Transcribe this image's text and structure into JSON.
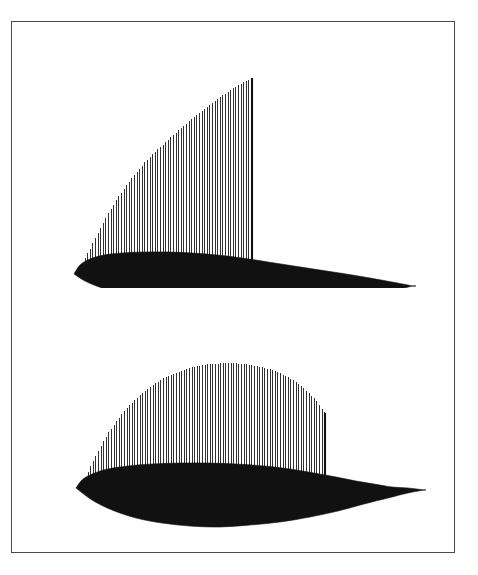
{
  "plate": {
    "background_color": "#ffffff",
    "border_color": "#4a4a4a",
    "ink_color": "#111111",
    "hatch_color": "#1a1a1a",
    "caption": ""
  },
  "chart_data": {
    "type": "area",
    "title": "",
    "subtitle": "",
    "xlabel": "",
    "ylabel": "",
    "grid": false,
    "legend_position": "none",
    "panels": [
      {
        "name": "upper-panel",
        "label": "",
        "airfoil": {
          "name": "airfoil-upper",
          "chord_px": 330,
          "leading_edge": [
            62,
            252
          ],
          "trailing_edge": [
            401,
            264
          ],
          "upper_surface": [
            [
              62,
              252
            ],
            [
              68,
              243
            ],
            [
              78,
              237
            ],
            [
              92,
              233
            ],
            [
              110,
              231
            ],
            [
              132,
              230
            ],
            [
              156,
              230
            ],
            [
              180,
              231
            ],
            [
              205,
              233
            ],
            [
              230,
              236
            ],
            [
              256,
              240
            ],
            [
              282,
              244
            ],
            [
              308,
              248
            ],
            [
              334,
              252
            ],
            [
              358,
              256
            ],
            [
              380,
              260
            ],
            [
              401,
              264
            ]
          ],
          "lower_surface": [
            [
              401,
              264
            ],
            [
              378,
              269
            ],
            [
              352,
              274
            ],
            [
              324,
              278
            ],
            [
              294,
              281
            ],
            [
              262,
              283
            ],
            [
              230,
              284
            ],
            [
              198,
              283
            ],
            [
              168,
              281
            ],
            [
              140,
              277
            ],
            [
              113,
              272
            ],
            [
              90,
              266
            ],
            [
              73,
              259
            ],
            [
              62,
              252
            ]
          ]
        },
        "pressure_curve": {
          "name": "pressure-curve-upper",
          "shape": "rising-to-abrupt-cutoff",
          "start_x": 73,
          "cutoff_x": 240,
          "peak_point": [
            240,
            56
          ],
          "points": [
            [
              73,
              236
            ],
            [
              78,
              227
            ],
            [
              84,
              215
            ],
            [
              90,
              203
            ],
            [
              97,
              190
            ],
            [
              105,
              177
            ],
            [
              114,
              164
            ],
            [
              124,
              151
            ],
            [
              134,
              139
            ],
            [
              145,
              128
            ],
            [
              157,
              117
            ],
            [
              169,
              106
            ],
            [
              181,
              96
            ],
            [
              194,
              86
            ],
            [
              207,
              76
            ],
            [
              220,
              67
            ],
            [
              232,
              60
            ],
            [
              240,
              56
            ]
          ]
        },
        "hatch": {
          "orientation": "vertical",
          "spacing_px": 2.6,
          "line_width_px": 0.9,
          "count": 64
        }
      },
      {
        "name": "lower-panel",
        "label": "",
        "airfoil": {
          "name": "airfoil-lower",
          "chord_px": 345,
          "leading_edge": [
            64,
            466
          ],
          "trailing_edge": [
            412,
            468
          ],
          "upper_surface": [
            [
              64,
              466
            ],
            [
              70,
              458
            ],
            [
              80,
              452
            ],
            [
              96,
              447
            ],
            [
              116,
              444
            ],
            [
              140,
              442
            ],
            [
              168,
              441
            ],
            [
              196,
              441
            ],
            [
              224,
              442
            ],
            [
              252,
              444
            ],
            [
              278,
              447
            ],
            [
              302,
              451
            ],
            [
              324,
              455
            ],
            [
              344,
              459
            ],
            [
              362,
              462
            ],
            [
              380,
              465
            ],
            [
              396,
              466
            ],
            [
              412,
              468
            ]
          ],
          "lower_surface": [
            [
              412,
              468
            ],
            [
              396,
              471
            ],
            [
              376,
              476
            ],
            [
              352,
              482
            ],
            [
              326,
              489
            ],
            [
              298,
              495
            ],
            [
              268,
              500
            ],
            [
              238,
              503
            ],
            [
              208,
              505
            ],
            [
              178,
              504
            ],
            [
              150,
              501
            ],
            [
              124,
              496
            ],
            [
              100,
              488
            ],
            [
              80,
              478
            ],
            [
              64,
              466
            ]
          ]
        },
        "pressure_curve": {
          "name": "pressure-curve-lower",
          "shape": "dome-with-abrupt-cutoff",
          "start_x": 76,
          "cutoff_x": 313,
          "peak_point": [
            216,
            341
          ],
          "points": [
            [
              76,
              450
            ],
            [
              82,
              437
            ],
            [
              89,
              424
            ],
            [
              97,
              410
            ],
            [
              106,
              397
            ],
            [
              116,
              385
            ],
            [
              127,
              374
            ],
            [
              139,
              364
            ],
            [
              152,
              356
            ],
            [
              166,
              350
            ],
            [
              181,
              345
            ],
            [
              197,
              342
            ],
            [
              216,
              341
            ],
            [
              234,
              342
            ],
            [
              250,
              345
            ],
            [
              264,
              349
            ],
            [
              276,
              355
            ],
            [
              287,
              362
            ],
            [
              296,
              370
            ],
            [
              304,
              378
            ],
            [
              309,
              385
            ],
            [
              313,
              391
            ]
          ]
        },
        "hatch": {
          "orientation": "vertical",
          "spacing_px": 2.6,
          "line_width_px": 0.9,
          "count": 91
        }
      }
    ]
  }
}
